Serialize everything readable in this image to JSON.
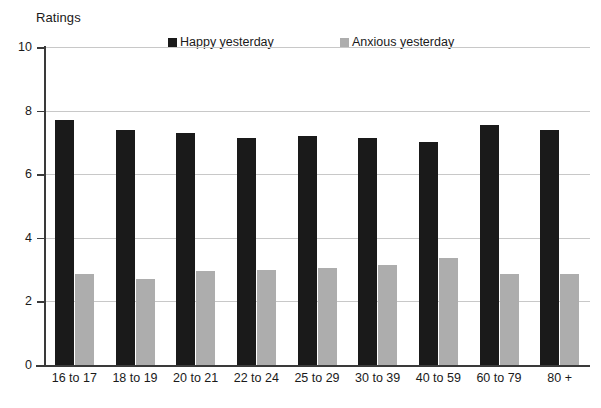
{
  "chart_data": {
    "type": "bar",
    "title": "",
    "ylabel": "Ratings",
    "xlabel": "",
    "ylim": [
      0,
      10
    ],
    "yticks": [
      0,
      2,
      4,
      6,
      8,
      10
    ],
    "grid": true,
    "legend_position": "top",
    "categories": [
      "16 to 17",
      "18 to 19",
      "20 to 21",
      "22 to 24",
      "25 to 29",
      "30 to 39",
      "40 to 59",
      "60 to 79",
      "80 +"
    ],
    "series": [
      {
        "name": "Happy yesterday",
        "color": "#1a1a1a",
        "values": [
          7.7,
          7.4,
          7.3,
          7.15,
          7.2,
          7.15,
          7.0,
          7.55,
          7.4
        ]
      },
      {
        "name": "Anxious yesterday",
        "color": "#adadad",
        "values": [
          2.85,
          2.7,
          2.95,
          3.0,
          3.05,
          3.15,
          3.35,
          2.85,
          2.85
        ]
      }
    ]
  },
  "axis": {
    "y_title": "Ratings",
    "tick_labels": [
      "10",
      "8",
      "6",
      "4",
      "2",
      "0"
    ]
  },
  "legend": {
    "items": [
      {
        "label": "Happy yesterday",
        "color": "#1a1a1a"
      },
      {
        "label": "Anxious yesterday",
        "color": "#adadad"
      }
    ]
  },
  "colors": {
    "happy": "#1a1a1a",
    "anxious": "#adadad",
    "gridline": "#c8c8c8",
    "axis": "#3a3a3a",
    "background": "#ffffff"
  }
}
